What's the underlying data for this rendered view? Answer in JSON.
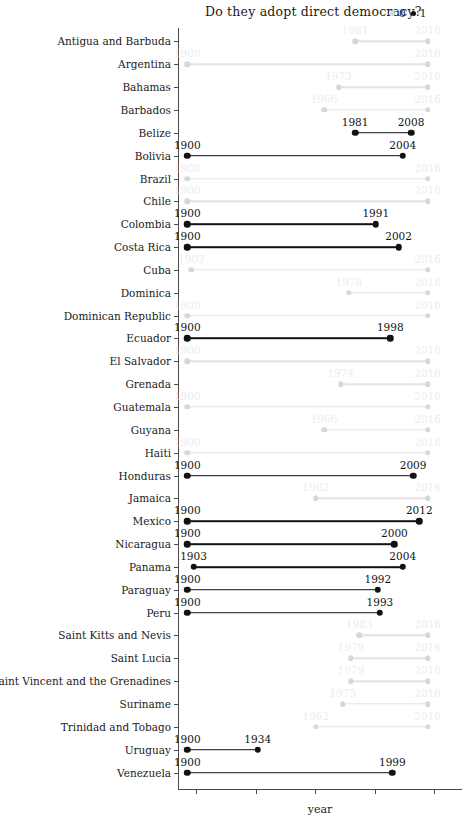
{
  "chart_data": {
    "type": "bar",
    "subtype": "dumbbell-range",
    "title": "Do they adopt direct democracy?",
    "xlabel": "year",
    "ylabel": "",
    "xlim": [
      1896,
      2022
    ],
    "x_tick_count": 5,
    "x_tick_labels": [],
    "grid": false,
    "legend": {
      "position": "top-right",
      "title": "",
      "entries": [
        {
          "label": "0",
          "color": "#d7d7d7"
        },
        {
          "label": "1",
          "color": "#121212"
        }
      ]
    },
    "categories": [
      "Antigua and Barbuda",
      "Argentina",
      "Bahamas",
      "Barbados",
      "Belize",
      "Bolivia",
      "Brazil",
      "Chile",
      "Colombia",
      "Costa Rica",
      "Cuba",
      "Dominica",
      "Dominican Republic",
      "Ecuador",
      "El Salvador",
      "Grenada",
      "Guatemala",
      "Guyana",
      "Haiti",
      "Honduras",
      "Jamaica",
      "Mexico",
      "Nicaragua",
      "Panama",
      "Paraguay",
      "Peru",
      "Saint Kitts and Nevis",
      "Saint Lucia",
      "Saint Vincent and the Grenadines",
      "Suriname",
      "Trinidad and Tobago",
      "Uruguay",
      "Venezuela"
    ],
    "rows": [
      {
        "country": "Antigua and Barbuda",
        "start": 1981,
        "end": 2016,
        "adopted": 0
      },
      {
        "country": "Argentina",
        "start": 1900,
        "end": 2016,
        "adopted": 0
      },
      {
        "country": "Bahamas",
        "start": 1973,
        "end": 2016,
        "adopted": 0
      },
      {
        "country": "Barbados",
        "start": 1966,
        "end": 2016,
        "adopted": 0
      },
      {
        "country": "Belize",
        "start": 1981,
        "end": 2008,
        "adopted": 1
      },
      {
        "country": "Bolivia",
        "start": 1900,
        "end": 2004,
        "adopted": 1
      },
      {
        "country": "Brazil",
        "start": 1900,
        "end": 2016,
        "adopted": 0
      },
      {
        "country": "Chile",
        "start": 1900,
        "end": 2016,
        "adopted": 0
      },
      {
        "country": "Colombia",
        "start": 1900,
        "end": 1991,
        "adopted": 1
      },
      {
        "country": "Costa Rica",
        "start": 1900,
        "end": 2002,
        "adopted": 1
      },
      {
        "country": "Cuba",
        "start": 1902,
        "end": 2016,
        "adopted": 0
      },
      {
        "country": "Dominica",
        "start": 1978,
        "end": 2016,
        "adopted": 0
      },
      {
        "country": "Dominican Republic",
        "start": 1900,
        "end": 2016,
        "adopted": 0
      },
      {
        "country": "Ecuador",
        "start": 1900,
        "end": 1998,
        "adopted": 1
      },
      {
        "country": "El Salvador",
        "start": 1900,
        "end": 2016,
        "adopted": 0
      },
      {
        "country": "Grenada",
        "start": 1974,
        "end": 2016,
        "adopted": 0
      },
      {
        "country": "Guatemala",
        "start": 1900,
        "end": 2016,
        "adopted": 0
      },
      {
        "country": "Guyana",
        "start": 1966,
        "end": 2016,
        "adopted": 0
      },
      {
        "country": "Haiti",
        "start": 1900,
        "end": 2016,
        "adopted": 0
      },
      {
        "country": "Honduras",
        "start": 1900,
        "end": 2009,
        "adopted": 1
      },
      {
        "country": "Jamaica",
        "start": 1962,
        "end": 2016,
        "adopted": 0
      },
      {
        "country": "Mexico",
        "start": 1900,
        "end": 2012,
        "adopted": 1
      },
      {
        "country": "Nicaragua",
        "start": 1900,
        "end": 2000,
        "adopted": 1
      },
      {
        "country": "Panama",
        "start": 1903,
        "end": 2004,
        "adopted": 1
      },
      {
        "country": "Paraguay",
        "start": 1900,
        "end": 1992,
        "adopted": 1
      },
      {
        "country": "Peru",
        "start": 1900,
        "end": 1993,
        "adopted": 1
      },
      {
        "country": "Saint Kitts and Nevis",
        "start": 1983,
        "end": 2016,
        "adopted": 0
      },
      {
        "country": "Saint Lucia",
        "start": 1979,
        "end": 2016,
        "adopted": 0
      },
      {
        "country": "Saint Vincent and the Grenadines",
        "start": 1979,
        "end": 2016,
        "adopted": 0
      },
      {
        "country": "Suriname",
        "start": 1975,
        "end": 2016,
        "adopted": 0
      },
      {
        "country": "Trinidad and Tobago",
        "start": 1962,
        "end": 2016,
        "adopted": 0
      },
      {
        "country": "Uruguay",
        "start": 1900,
        "end": 1934,
        "adopted": 1
      },
      {
        "country": "Venezuela",
        "start": 1900,
        "end": 1999,
        "adopted": 1
      }
    ],
    "colors": {
      "adopted_1": "#121212",
      "adopted_0": "#d7d7d7",
      "axis": "#4a4a4a"
    }
  }
}
